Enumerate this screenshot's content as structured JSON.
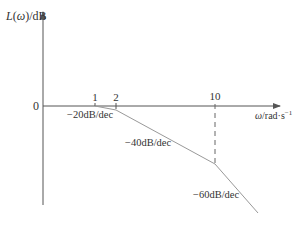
{
  "diagram": {
    "type": "bode-magnitude-asymptotic",
    "y_axis": {
      "label_func": "L",
      "label_var": "ω",
      "label_unit": "/dB"
    },
    "x_axis": {
      "label_var": "ω",
      "label_unit": "/rad·s",
      "label_exp": "−1"
    },
    "origin_label": "0",
    "breakpoints": [
      {
        "label": "1",
        "x": 95
      },
      {
        "label": "2",
        "x": 116
      },
      {
        "label": "10",
        "x": 215
      }
    ],
    "slopes": [
      {
        "label": "−20dB/dec",
        "segment": "1–2"
      },
      {
        "label": "−40dB/dec",
        "segment": "2–10"
      },
      {
        "label": "−60dB/dec",
        "segment": ">10"
      }
    ],
    "colors": {
      "axis": "#555555",
      "curve": "#999999",
      "text": "#333333"
    }
  }
}
